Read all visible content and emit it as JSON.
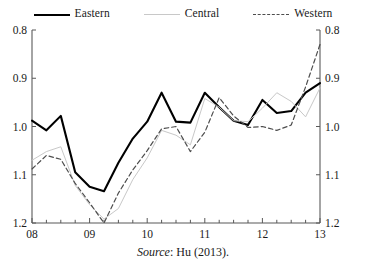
{
  "legend": {
    "position": "top-center",
    "entries": [
      {
        "label": "Eastern",
        "style": "solid-thick-black",
        "color": "#000000"
      },
      {
        "label": "Central",
        "style": "solid-thin-gray",
        "color": "#c8c8c8"
      },
      {
        "label": "Western",
        "style": "dashed-gray",
        "color": "#4d4d4d"
      }
    ]
  },
  "source": {
    "prefix": "Source",
    "text": ": Hu (2013)."
  },
  "axes": {
    "y_left_ticks": [
      "1.2",
      "1.1",
      "1.0",
      "0.9",
      "0.8"
    ],
    "y_right_ticks": [
      "1.2",
      "1.1",
      "1.0",
      "0.9",
      "0.8"
    ],
    "x_ticks": [
      "08",
      "09",
      "10",
      "11",
      "12",
      "13"
    ]
  },
  "chart_data": {
    "type": "line",
    "title": "",
    "subtitle": "",
    "xlabel": "",
    "ylabel": "",
    "xlim": [
      2008.0,
      2013.0
    ],
    "ylim": [
      0.8,
      1.2
    ],
    "y_ticks": [
      0.8,
      0.9,
      1.0,
      1.1,
      1.2
    ],
    "x_tick_values": [
      2008,
      2009,
      2010,
      2011,
      2012,
      2013
    ],
    "x_tick_labels": [
      "08",
      "09",
      "10",
      "11",
      "12",
      "13"
    ],
    "x_minor_tick_interval": 0.25,
    "grid": false,
    "dual_y_axis": true,
    "legend_position": "top-center",
    "annotations": [
      "Source: Hu (2013)."
    ],
    "x": [
      2008.0,
      2008.25,
      2008.5,
      2008.75,
      2009.0,
      2009.25,
      2009.5,
      2009.75,
      2010.0,
      2010.25,
      2010.5,
      2010.75,
      2011.0,
      2011.25,
      2011.5,
      2011.75,
      2012.0,
      2012.25,
      2012.5,
      2012.75,
      2013.0
    ],
    "series": [
      {
        "name": "Eastern",
        "color": "#000000",
        "style": "solid",
        "width": 2.1,
        "values": [
          1.012,
          0.992,
          1.022,
          0.905,
          0.875,
          0.866,
          0.925,
          0.975,
          1.01,
          1.07,
          1.01,
          1.008,
          1.07,
          1.04,
          1.012,
          1.003,
          1.055,
          1.028,
          1.032,
          1.07,
          1.09
        ]
      },
      {
        "name": "Central",
        "color": "#c8c8c8",
        "style": "solid-thin",
        "width": 1.0,
        "values": [
          0.93,
          0.948,
          0.958,
          0.878,
          0.838,
          0.808,
          0.83,
          0.89,
          0.935,
          0.992,
          0.982,
          0.962,
          1.058,
          1.04,
          1.012,
          1.01,
          1.038,
          1.07,
          1.052,
          1.02,
          1.08
        ]
      },
      {
        "name": "Western",
        "color": "#4d4d4d",
        "style": "dashed",
        "width": 1.2,
        "values": [
          0.912,
          0.94,
          0.932,
          0.882,
          0.842,
          0.8,
          0.862,
          0.91,
          0.95,
          0.995,
          1.0,
          0.948,
          0.988,
          1.06,
          1.022,
          0.998,
          1.0,
          0.992,
          1.003,
          1.082,
          1.17
        ]
      }
    ]
  }
}
